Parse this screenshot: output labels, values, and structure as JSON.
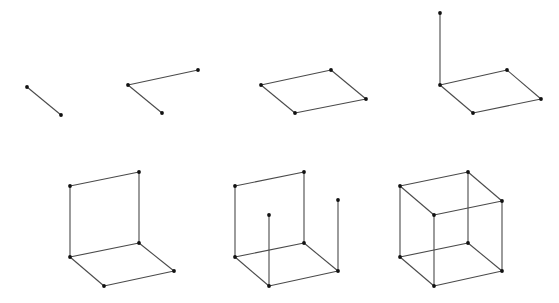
{
  "diagram": {
    "stroke_color": "#4a4a4a",
    "vertex_color": "#111111",
    "vertex_radius": 1.9,
    "figures": [
      {
        "id": "step-1",
        "description": "single edge",
        "vertices": [
          [
            27,
            87
          ],
          [
            61,
            115
          ]
        ],
        "edges": [
          [
            0,
            1
          ]
        ]
      },
      {
        "id": "step-2",
        "description": "two edges",
        "vertices": [
          [
            128,
            85
          ],
          [
            162,
            113
          ],
          [
            198,
            70
          ]
        ],
        "edges": [
          [
            0,
            1
          ],
          [
            0,
            2
          ]
        ]
      },
      {
        "id": "step-3",
        "description": "bottom square face",
        "vertices": [
          [
            261,
            85
          ],
          [
            295,
            113
          ],
          [
            366,
            99
          ],
          [
            331,
            70
          ]
        ],
        "edges": [
          [
            0,
            1
          ],
          [
            1,
            2
          ],
          [
            2,
            3
          ],
          [
            3,
            0
          ]
        ]
      },
      {
        "id": "step-4",
        "description": "square face plus one vertical edge",
        "vertices": [
          [
            440,
            85
          ],
          [
            473,
            113
          ],
          [
            541,
            99
          ],
          [
            507,
            70
          ],
          [
            440,
            13
          ]
        ],
        "edges": [
          [
            0,
            1
          ],
          [
            1,
            2
          ],
          [
            2,
            3
          ],
          [
            3,
            0
          ],
          [
            0,
            4
          ]
        ]
      },
      {
        "id": "step-5",
        "description": "bottom face plus back face",
        "vertices": [
          [
            70,
            257
          ],
          [
            104,
            286
          ],
          [
            174,
            271
          ],
          [
            139,
            243
          ],
          [
            70,
            186
          ],
          [
            139,
            172
          ]
        ],
        "edges": [
          [
            0,
            1
          ],
          [
            1,
            2
          ],
          [
            2,
            3
          ],
          [
            3,
            0
          ],
          [
            0,
            4
          ],
          [
            3,
            5
          ],
          [
            4,
            5
          ]
        ]
      },
      {
        "id": "step-6",
        "description": "bottom face, back face and two front verticals",
        "vertices": [
          [
            235,
            257
          ],
          [
            269,
            286
          ],
          [
            338,
            271
          ],
          [
            304,
            243
          ],
          [
            235,
            186
          ],
          [
            304,
            172
          ],
          [
            269,
            215
          ],
          [
            338,
            200
          ]
        ],
        "edges": [
          [
            0,
            1
          ],
          [
            1,
            2
          ],
          [
            2,
            3
          ],
          [
            3,
            0
          ],
          [
            0,
            4
          ],
          [
            3,
            5
          ],
          [
            4,
            5
          ],
          [
            1,
            6
          ],
          [
            2,
            7
          ]
        ]
      },
      {
        "id": "step-7",
        "description": "complete cube",
        "vertices": [
          [
            400,
            257
          ],
          [
            434,
            286
          ],
          [
            502,
            271
          ],
          [
            468,
            243
          ],
          [
            400,
            186
          ],
          [
            468,
            172
          ],
          [
            434,
            215
          ],
          [
            502,
            201
          ]
        ],
        "edges": [
          [
            0,
            1
          ],
          [
            1,
            2
          ],
          [
            2,
            3
          ],
          [
            3,
            0
          ],
          [
            0,
            4
          ],
          [
            3,
            5
          ],
          [
            4,
            5
          ],
          [
            1,
            6
          ],
          [
            2,
            7
          ],
          [
            4,
            6
          ],
          [
            6,
            7
          ],
          [
            7,
            5
          ]
        ]
      }
    ]
  }
}
